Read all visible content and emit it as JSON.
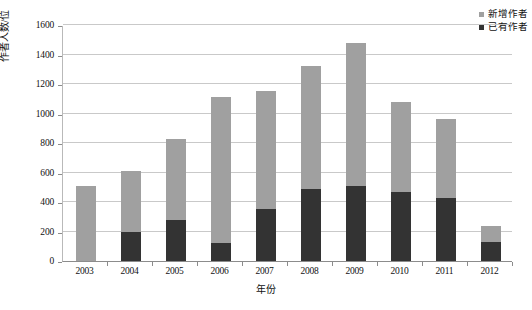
{
  "chart_data": {
    "type": "bar",
    "subtype": "stacked-bar",
    "title": "",
    "xlabel": "年份",
    "ylabel": "作者人数/位",
    "categories": [
      "2003",
      "2004",
      "2005",
      "2006",
      "2007",
      "2008",
      "2009",
      "2010",
      "2011",
      "2012"
    ],
    "series": [
      {
        "name": "已有作者",
        "color": "#333333",
        "values": [
          0,
          200,
          280,
          120,
          355,
          490,
          510,
          470,
          430,
          130
        ]
      },
      {
        "name": "新增作者",
        "color": "#a0a0a0",
        "values": [
          510,
          410,
          550,
          990,
          795,
          835,
          970,
          610,
          530,
          110
        ]
      }
    ],
    "totals": [
      510,
      610,
      830,
      1110,
      1150,
      1325,
      1480,
      1080,
      960,
      240
    ],
    "ylim": [
      0,
      1600
    ],
    "ytick_values": [
      0,
      200,
      400,
      600,
      800,
      1000,
      1200,
      1400,
      1600
    ],
    "ytick_labels": [
      "0",
      "200",
      "400",
      "600",
      "800",
      "1000",
      "1200",
      "1400",
      "1600"
    ],
    "grid": true,
    "grid_axis": "y",
    "legend_position": "top-right",
    "stack_order": "existing-bottom-new-top"
  },
  "legend": {
    "items": [
      {
        "label": "新增作者",
        "color": "#a0a0a0"
      },
      {
        "label": "已有作者",
        "color": "#333333"
      }
    ]
  },
  "axes": {
    "y_title": "作者人数/位",
    "x_title": "年份"
  }
}
